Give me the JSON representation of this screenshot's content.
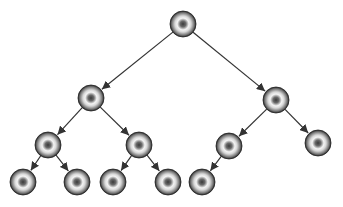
{
  "diagram": {
    "type": "binary-tree",
    "node_radius": 13,
    "colors": {
      "edge": "#333333",
      "node_dark": "#2a2a2a",
      "node_mid": "#7a7a7a",
      "node_light": "#f2f2f2",
      "node_core": "#4a4a4a"
    },
    "nodes": [
      {
        "id": "n0",
        "x": 183,
        "y": 24
      },
      {
        "id": "n1",
        "x": 91,
        "y": 98
      },
      {
        "id": "n2",
        "x": 276,
        "y": 100
      },
      {
        "id": "n3",
        "x": 48,
        "y": 145
      },
      {
        "id": "n4",
        "x": 139,
        "y": 145
      },
      {
        "id": "n5",
        "x": 229,
        "y": 146
      },
      {
        "id": "n6",
        "x": 318,
        "y": 143
      },
      {
        "id": "n7",
        "x": 23,
        "y": 182
      },
      {
        "id": "n8",
        "x": 77,
        "y": 182
      },
      {
        "id": "n9",
        "x": 113,
        "y": 182
      },
      {
        "id": "n10",
        "x": 168,
        "y": 182
      },
      {
        "id": "n11",
        "x": 202,
        "y": 182
      }
    ],
    "edges": [
      {
        "from": "n0",
        "to": "n1"
      },
      {
        "from": "n0",
        "to": "n2"
      },
      {
        "from": "n1",
        "to": "n3"
      },
      {
        "from": "n1",
        "to": "n4"
      },
      {
        "from": "n2",
        "to": "n5"
      },
      {
        "from": "n2",
        "to": "n6"
      },
      {
        "from": "n3",
        "to": "n7"
      },
      {
        "from": "n3",
        "to": "n8"
      },
      {
        "from": "n4",
        "to": "n9"
      },
      {
        "from": "n4",
        "to": "n10"
      },
      {
        "from": "n5",
        "to": "n11"
      }
    ]
  }
}
